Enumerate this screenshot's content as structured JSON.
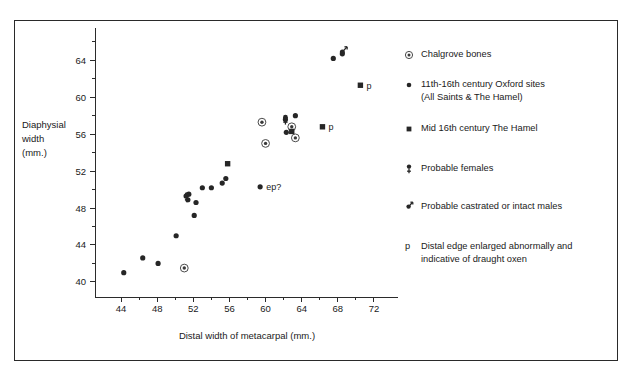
{
  "chart_data": {
    "type": "scatter",
    "title": "",
    "xlabel": "Distal width of metacarpal  (mm.)",
    "ylabel": "Diaphysial width (mm.)",
    "ylabel_lines": [
      "Diaphysial",
      "width",
      "(mm.)"
    ],
    "xlim": [
      42,
      74
    ],
    "ylim": [
      38.8,
      66.2
    ],
    "xticks": [
      44,
      48,
      52,
      56,
      60,
      64,
      68,
      72
    ],
    "yticks": [
      40,
      44,
      48,
      52,
      56,
      60,
      64
    ],
    "xtick_minor_step": 2,
    "ytick_minor_step": 2,
    "grid": false,
    "legend_position": "right",
    "series": [
      {
        "name": "Chalgrove bones",
        "marker": "circled-dot",
        "points": [
          {
            "x": 51.0,
            "y": 41.5,
            "label": ""
          },
          {
            "x": 59.6,
            "y": 57.3,
            "label": ""
          },
          {
            "x": 60.0,
            "y": 55.0,
            "label": ""
          },
          {
            "x": 62.9,
            "y": 56.8,
            "label": ""
          },
          {
            "x": 63.3,
            "y": 55.6,
            "label": ""
          }
        ]
      },
      {
        "name": "11th-16th century Oxford sites (All Saints & The Hamel)",
        "marker": "dot",
        "points": [
          {
            "x": 44.3,
            "y": 41.0,
            "label": ""
          },
          {
            "x": 46.4,
            "y": 42.6,
            "label": ""
          },
          {
            "x": 48.1,
            "y": 42.0,
            "label": ""
          },
          {
            "x": 50.1,
            "y": 45.0,
            "label": ""
          },
          {
            "x": 51.2,
            "y": 49.3,
            "label": ""
          },
          {
            "x": 51.4,
            "y": 48.9,
            "label": ""
          },
          {
            "x": 51.5,
            "y": 49.5,
            "label": ""
          },
          {
            "x": 52.3,
            "y": 48.6,
            "label": ""
          },
          {
            "x": 52.1,
            "y": 47.2,
            "label": ""
          },
          {
            "x": 53.0,
            "y": 50.2,
            "label": ""
          },
          {
            "x": 54.0,
            "y": 50.2,
            "label": ""
          },
          {
            "x": 55.2,
            "y": 50.7,
            "label": ""
          },
          {
            "x": 55.6,
            "y": 51.2,
            "label": ""
          },
          {
            "x": 59.4,
            "y": 50.3,
            "label": "ep?"
          },
          {
            "x": 62.2,
            "y": 57.6,
            "label": ""
          },
          {
            "x": 63.3,
            "y": 58.0,
            "label": ""
          },
          {
            "x": 62.3,
            "y": 56.2,
            "label": ""
          },
          {
            "x": 67.5,
            "y": 64.2,
            "label": ""
          },
          {
            "x": 68.5,
            "y": 64.7,
            "label": ""
          }
        ]
      },
      {
        "name": "Mid 16th century The Hamel",
        "marker": "square",
        "points": [
          {
            "x": 55.8,
            "y": 52.8,
            "label": ""
          },
          {
            "x": 62.9,
            "y": 56.3,
            "label": ""
          },
          {
            "x": 66.3,
            "y": 56.8,
            "label": "p"
          },
          {
            "x": 70.5,
            "y": 61.3,
            "label": "p"
          }
        ]
      },
      {
        "name": "Probable females",
        "marker": "female",
        "points": [
          {
            "x": 51.3,
            "y": 49.2,
            "label": ""
          },
          {
            "x": 62.2,
            "y": 57.6,
            "label": ""
          }
        ]
      },
      {
        "name": "Probable castrated or intact males",
        "marker": "male",
        "points": [
          {
            "x": 68.5,
            "y": 64.9,
            "label": ""
          }
        ]
      }
    ],
    "annotations": [
      {
        "text": "ep?",
        "x": 59.4,
        "y": 50.3
      },
      {
        "text": "p",
        "x": 66.3,
        "y": 56.8
      },
      {
        "text": "p",
        "x": 70.5,
        "y": 61.3
      }
    ]
  },
  "legend": {
    "items": [
      {
        "marker": "circled-dot",
        "line1": "Chalgrove bones",
        "line2": ""
      },
      {
        "marker": "dot",
        "line1": "11th-16th century Oxford sites",
        "line2": "(All Saints & The Hamel)"
      },
      {
        "marker": "square",
        "line1": "Mid 16th century The Hamel",
        "line2": ""
      },
      {
        "marker": "female",
        "line1": "Probable females",
        "line2": ""
      },
      {
        "marker": "male",
        "line1": "Probable castrated or intact males",
        "line2": ""
      },
      {
        "marker": "p-letter",
        "line1": "Distal edge enlarged abnormally and",
        "line2": "indicative of draught oxen"
      }
    ],
    "p_glyph": "p"
  },
  "colors": {
    "ink": "#262626",
    "frame": "#2a2a2a",
    "background": "#ffffff"
  }
}
